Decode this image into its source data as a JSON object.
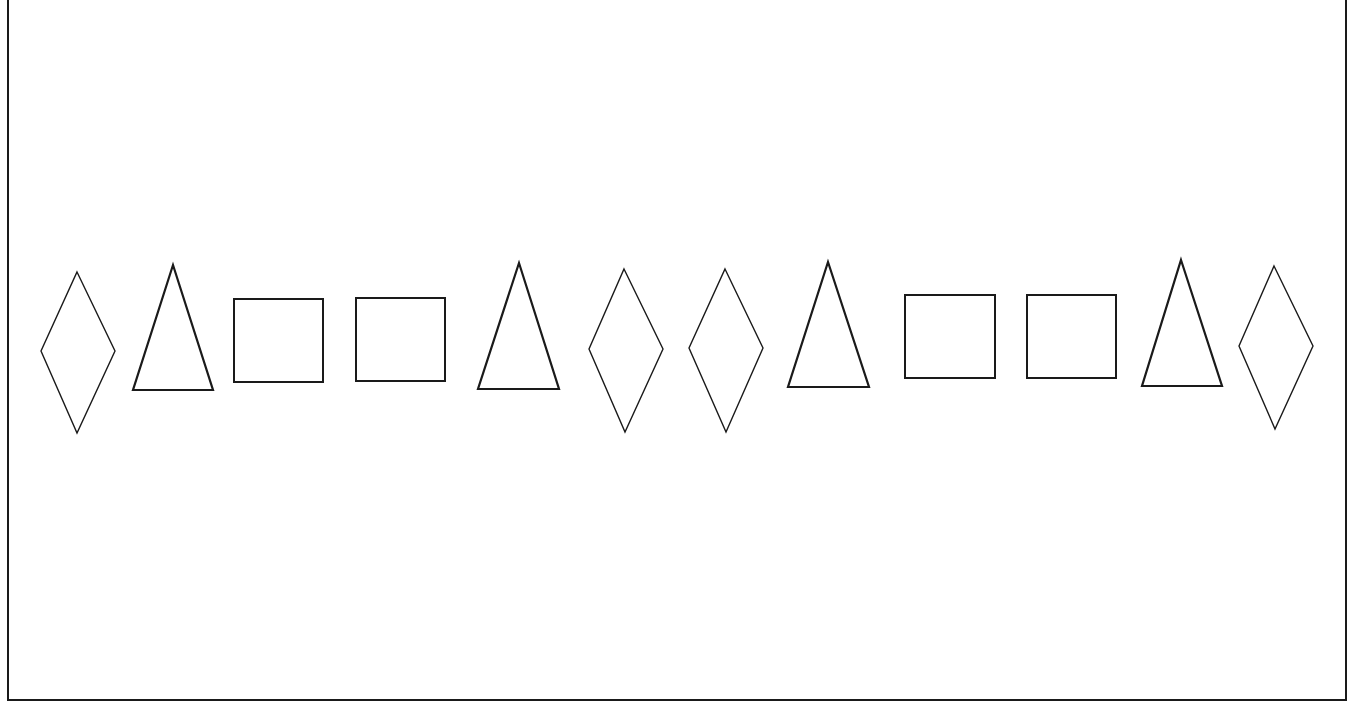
{
  "figure": {
    "stroke_color": "#1a1a1a",
    "background": "#ffffff",
    "border": {
      "left": 8,
      "right": 1346,
      "bottom": 700,
      "top": -5
    },
    "sequence": [
      "diamond",
      "triangle",
      "square",
      "square",
      "triangle",
      "diamond",
      "diamond",
      "triangle",
      "square",
      "square",
      "triangle",
      "diamond"
    ],
    "shapes": [
      {
        "type": "diamond",
        "points": "77,272 115,351 77,433 41,351"
      },
      {
        "type": "triangle",
        "points": "173,265 213,390 133,390"
      },
      {
        "type": "square",
        "points": "234,299 323,299 323,382 234,382"
      },
      {
        "type": "square",
        "points": "356,298 445,298 445,381 356,381"
      },
      {
        "type": "triangle",
        "points": "519,263 559,389 478,389"
      },
      {
        "type": "diamond",
        "points": "624,269 663,349 625,432 589,349"
      },
      {
        "type": "diamond",
        "points": "725,269 763,348 726,432 689,348"
      },
      {
        "type": "triangle",
        "points": "828,262 869,387 788,387"
      },
      {
        "type": "square",
        "points": "905,295 995,295 995,378 905,378"
      },
      {
        "type": "square",
        "points": "1027,295 1116,295 1116,378 1027,378"
      },
      {
        "type": "triangle",
        "points": "1181,260 1222,386 1142,386"
      },
      {
        "type": "diamond",
        "points": "1274,266 1313,346 1275,429 1239,346"
      }
    ]
  }
}
